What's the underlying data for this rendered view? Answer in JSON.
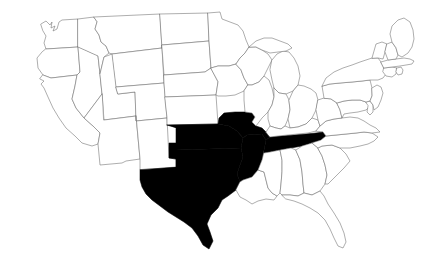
{
  "map": {
    "title": "United States Map",
    "region": "Contiguous United States",
    "projection": "albers-usa",
    "background_color": "#ffffff",
    "default_state_fill": "#ffffff",
    "highlight_fill": "#000000",
    "border_color": "#6a6a6a",
    "highlighted_states": [
      "TX",
      "OK",
      "AR",
      "MO",
      "TN"
    ],
    "highlighted_state_names": [
      "Texas",
      "Oklahoma",
      "Arkansas",
      "Missouri",
      "Tennessee"
    ],
    "highlighted_count": 5,
    "total_states_shown": 49,
    "states": [
      {
        "code": "WA",
        "name": "Washington",
        "highlighted": false
      },
      {
        "code": "OR",
        "name": "Oregon",
        "highlighted": false
      },
      {
        "code": "CA",
        "name": "California",
        "highlighted": false
      },
      {
        "code": "NV",
        "name": "Nevada",
        "highlighted": false
      },
      {
        "code": "ID",
        "name": "Idaho",
        "highlighted": false
      },
      {
        "code": "MT",
        "name": "Montana",
        "highlighted": false
      },
      {
        "code": "WY",
        "name": "Wyoming",
        "highlighted": false
      },
      {
        "code": "UT",
        "name": "Utah",
        "highlighted": false
      },
      {
        "code": "AZ",
        "name": "Arizona",
        "highlighted": false
      },
      {
        "code": "CO",
        "name": "Colorado",
        "highlighted": false
      },
      {
        "code": "NM",
        "name": "New Mexico",
        "highlighted": false
      },
      {
        "code": "ND",
        "name": "North Dakota",
        "highlighted": false
      },
      {
        "code": "SD",
        "name": "South Dakota",
        "highlighted": false
      },
      {
        "code": "NE",
        "name": "Nebraska",
        "highlighted": false
      },
      {
        "code": "KS",
        "name": "Kansas",
        "highlighted": false
      },
      {
        "code": "OK",
        "name": "Oklahoma",
        "highlighted": true
      },
      {
        "code": "TX",
        "name": "Texas",
        "highlighted": true
      },
      {
        "code": "MN",
        "name": "Minnesota",
        "highlighted": false
      },
      {
        "code": "IA",
        "name": "Iowa",
        "highlighted": false
      },
      {
        "code": "MO",
        "name": "Missouri",
        "highlighted": true
      },
      {
        "code": "AR",
        "name": "Arkansas",
        "highlighted": true
      },
      {
        "code": "LA",
        "name": "Louisiana",
        "highlighted": false
      },
      {
        "code": "WI",
        "name": "Wisconsin",
        "highlighted": false
      },
      {
        "code": "IL",
        "name": "Illinois",
        "highlighted": false
      },
      {
        "code": "MS",
        "name": "Mississippi",
        "highlighted": false
      },
      {
        "code": "MI",
        "name": "Michigan",
        "highlighted": false
      },
      {
        "code": "IN",
        "name": "Indiana",
        "highlighted": false
      },
      {
        "code": "OH",
        "name": "Ohio",
        "highlighted": false
      },
      {
        "code": "KY",
        "name": "Kentucky",
        "highlighted": false
      },
      {
        "code": "TN",
        "name": "Tennessee",
        "highlighted": true
      },
      {
        "code": "AL",
        "name": "Alabama",
        "highlighted": false
      },
      {
        "code": "GA",
        "name": "Georgia",
        "highlighted": false
      },
      {
        "code": "FL",
        "name": "Florida",
        "highlighted": false
      },
      {
        "code": "SC",
        "name": "South Carolina",
        "highlighted": false
      },
      {
        "code": "NC",
        "name": "North Carolina",
        "highlighted": false
      },
      {
        "code": "VA",
        "name": "Virginia",
        "highlighted": false
      },
      {
        "code": "WV",
        "name": "West Virginia",
        "highlighted": false
      },
      {
        "code": "MD",
        "name": "Maryland",
        "highlighted": false
      },
      {
        "code": "DE",
        "name": "Delaware",
        "highlighted": false
      },
      {
        "code": "PA",
        "name": "Pennsylvania",
        "highlighted": false
      },
      {
        "code": "NJ",
        "name": "New Jersey",
        "highlighted": false
      },
      {
        "code": "NY",
        "name": "New York",
        "highlighted": false
      },
      {
        "code": "CT",
        "name": "Connecticut",
        "highlighted": false
      },
      {
        "code": "RI",
        "name": "Rhode Island",
        "highlighted": false
      },
      {
        "code": "MA",
        "name": "Massachusetts",
        "highlighted": false
      },
      {
        "code": "VT",
        "name": "Vermont",
        "highlighted": false
      },
      {
        "code": "NH",
        "name": "New Hampshire",
        "highlighted": false
      },
      {
        "code": "ME",
        "name": "Maine",
        "highlighted": false
      }
    ]
  }
}
